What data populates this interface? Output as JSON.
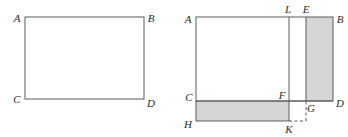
{
  "diagram": {
    "title_text": "",
    "background_color": "#ffffff",
    "stroke_color": "#5a5a5a",
    "shade_color": "#d6d6d6",
    "label_color": "#2b2b2b",
    "figures": [
      {
        "id": "figure-left",
        "kind": "rectangle",
        "description": "plain rectangle with vertices labelled A B C D",
        "rect": {
          "x": 25,
          "y": 17,
          "width": 119,
          "height": 82
        },
        "vertices": [
          {
            "name": "A",
            "label": "A",
            "x": 25,
            "y": 17,
            "label_x": 17,
            "label_y": 22
          },
          {
            "name": "B",
            "label": "B",
            "x": 144,
            "y": 17,
            "label_x": 149,
            "label_y": 22
          },
          {
            "name": "C",
            "label": "C",
            "x": 25,
            "y": 99,
            "label_x": 17,
            "label_y": 103
          },
          {
            "name": "D",
            "label": "D",
            "x": 144,
            "y": 99,
            "label_x": 149,
            "label_y": 106
          }
        ],
        "shaded_regions": [],
        "dashed_segments": []
      },
      {
        "id": "figure-right",
        "kind": "rectangle-with-shaded-strips",
        "description": "rectangle A B D C with a vertical shaded strip E B D G on the right, a horizontal shaded strip C F K H at the bottom, an interior vertical line L K and a small dashed square K G",
        "rect": {
          "x": 196,
          "y": 17,
          "width": 137,
          "height": 84
        },
        "vertices": [
          {
            "name": "A",
            "label": "A",
            "x": 196,
            "y": 17,
            "label_x": 187,
            "label_y": 22
          },
          {
            "name": "L",
            "label": "L",
            "x": 289,
            "y": 17,
            "label_x": 285,
            "label_y": 12
          },
          {
            "name": "E",
            "label": "E",
            "x": 306,
            "y": 17,
            "label_x": 302,
            "label_y": 12
          },
          {
            "name": "B",
            "label": "B",
            "x": 333,
            "y": 17,
            "label_x": 337,
            "label_y": 22
          },
          {
            "name": "C",
            "label": "C",
            "x": 196,
            "y": 101,
            "label_x": 187,
            "label_y": 100
          },
          {
            "name": "F",
            "label": "F",
            "x": 289,
            "y": 101,
            "label_x": 280,
            "label_y": 98
          },
          {
            "name": "G",
            "label": "G",
            "x": 306,
            "y": 101,
            "label_x": 308,
            "label_y": 111
          },
          {
            "name": "D",
            "label": "D",
            "x": 333,
            "y": 101,
            "label_x": 337,
            "label_y": 106
          },
          {
            "name": "H",
            "label": "H",
            "x": 196,
            "y": 121,
            "label_x": 186,
            "label_y": 125
          },
          {
            "name": "K",
            "label": "K",
            "x": 289,
            "y": 121,
            "label_x": 285,
            "label_y": 132
          }
        ],
        "shaded_regions": [
          {
            "name": "right-vertical-strip",
            "corner_labels": "E B D G",
            "x": 306,
            "y": 17,
            "width": 27,
            "height": 84
          },
          {
            "name": "bottom-horizontal-strip",
            "corner_labels": "C F K H",
            "x": 196,
            "y": 101,
            "width": 93,
            "height": 20
          }
        ],
        "interior_lines": [
          {
            "name": "line-L-K",
            "x1": 289,
            "y1": 17,
            "x2": 289,
            "y2": 121
          },
          {
            "name": "line-C-D",
            "x1": 196,
            "y1": 101,
            "x2": 333,
            "y2": 101
          },
          {
            "name": "line-E-G",
            "x1": 306,
            "y1": 17,
            "x2": 306,
            "y2": 101
          }
        ],
        "dashed_segments": [
          {
            "name": "dash-K-to-corner",
            "x1": 289,
            "y1": 121,
            "x2": 306,
            "y2": 121
          },
          {
            "name": "dash-corner-to-G",
            "x1": 306,
            "y1": 121,
            "x2": 306,
            "y2": 101
          }
        ]
      }
    ]
  }
}
